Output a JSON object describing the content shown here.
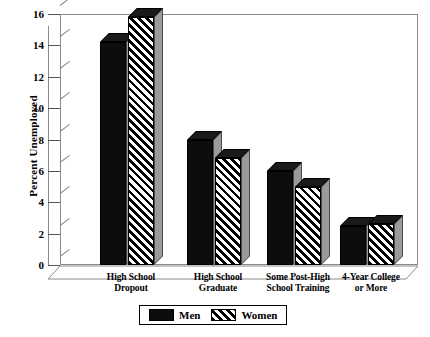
{
  "chart_data": {
    "type": "bar",
    "title": "",
    "xlabel": "",
    "ylabel": "Percent Unemployed",
    "ylim": [
      0,
      16
    ],
    "yticks": [
      0,
      2,
      4,
      6,
      8,
      10,
      12,
      14,
      16
    ],
    "grid": false,
    "legend_position": "bottom",
    "categories": [
      "High School Dropout",
      "High School Graduate",
      "Some Post-High School Training",
      "4-Year College or More"
    ],
    "category_lines": [
      [
        "High School",
        "Dropout"
      ],
      [
        "High School",
        "Graduate"
      ],
      [
        "Some Post-High",
        "School Training"
      ],
      [
        "4-Year College",
        "or More"
      ]
    ],
    "series": [
      {
        "name": "Men",
        "values": [
          14.2,
          8.0,
          6.0,
          2.5
        ]
      },
      {
        "name": "Women",
        "values": [
          15.8,
          6.8,
          5.0,
          2.6
        ]
      }
    ]
  },
  "legend": {
    "men_label": "Men",
    "women_label": "Women"
  },
  "axis": {
    "y_title": "Percent Unemployed",
    "tick_labels": [
      "0",
      "2",
      "4",
      "6",
      "8",
      "10",
      "12",
      "14",
      "16"
    ]
  },
  "colors": {
    "men_fill": "#0d0d0d",
    "women_fill": "#000000",
    "bar_side": "#9a9a9a",
    "bar_top": "#1a1a1a",
    "frame": "#8a8a8a",
    "background": "#ffffff"
  }
}
